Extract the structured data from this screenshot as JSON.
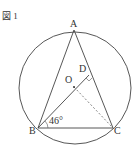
{
  "figure_label": "図 1",
  "points": {
    "A": "A",
    "B": "B",
    "C": "C",
    "D": "D",
    "O": "O"
  },
  "angle_label": "46°"
}
